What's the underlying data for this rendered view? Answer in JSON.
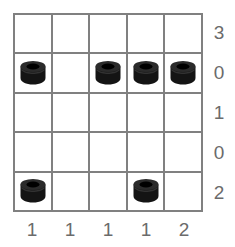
{
  "puzzle": {
    "type": "nonogram-style-grid",
    "grid": {
      "rows": 5,
      "columns": 5,
      "line_color": "#808080",
      "cell_color": "#ffffff"
    },
    "piece": {
      "icon": "black-cylinder-nut-icon",
      "body_color": "#141414",
      "rim_color": "#2b2b2b",
      "hole_color": "#000000"
    },
    "label_color": "#6b6b6b",
    "row_labels": [
      "3",
      "0",
      "1",
      "0",
      "2"
    ],
    "column_labels": [
      "1",
      "1",
      "1",
      "1",
      "2"
    ],
    "cells": [
      [
        {
          "piece": false
        },
        {
          "piece": false
        },
        {
          "piece": false
        },
        {
          "piece": false
        },
        {
          "piece": false
        }
      ],
      [
        {
          "piece": true
        },
        {
          "piece": false
        },
        {
          "piece": true
        },
        {
          "piece": true
        },
        {
          "piece": true
        }
      ],
      [
        {
          "piece": false
        },
        {
          "piece": false
        },
        {
          "piece": false
        },
        {
          "piece": false
        },
        {
          "piece": false
        }
      ],
      [
        {
          "piece": false
        },
        {
          "piece": false
        },
        {
          "piece": false
        },
        {
          "piece": false
        },
        {
          "piece": false
        }
      ],
      [
        {
          "piece": true
        },
        {
          "piece": false
        },
        {
          "piece": false
        },
        {
          "piece": true
        },
        {
          "piece": false
        }
      ]
    ]
  }
}
